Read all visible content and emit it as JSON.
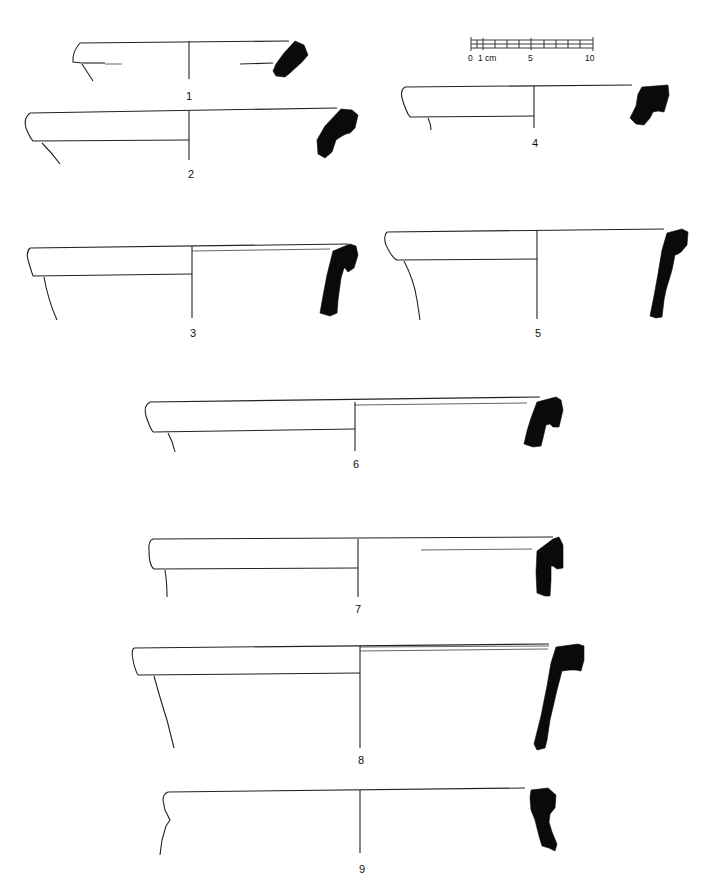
{
  "plate": {
    "type": "archaeological pottery rim profiles",
    "line_color": "#222222",
    "section_fill": "#0a0a0a",
    "background": "#ffffff"
  },
  "scale_bar": {
    "labels": [
      "0",
      "1 cm",
      "5",
      "10"
    ],
    "unit": "cm",
    "divisions": 10
  },
  "figures": [
    {
      "id": 1,
      "label": "1"
    },
    {
      "id": 2,
      "label": "2"
    },
    {
      "id": 3,
      "label": "3"
    },
    {
      "id": 4,
      "label": "4"
    },
    {
      "id": 5,
      "label": "5"
    },
    {
      "id": 6,
      "label": "6"
    },
    {
      "id": 7,
      "label": "7"
    },
    {
      "id": 8,
      "label": "8"
    },
    {
      "id": 9,
      "label": "9"
    }
  ]
}
